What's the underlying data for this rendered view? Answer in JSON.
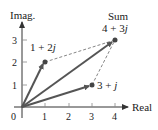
{
  "diagram": {
    "axes": {
      "x_label": "Real",
      "y_label": "Imag.",
      "origin_label": "0",
      "x_ticks": [
        "1",
        "2",
        "3",
        "4"
      ],
      "y_ticks": [
        "1",
        "2",
        "3"
      ]
    },
    "vectors": [
      {
        "name": "z1",
        "label": "1 + 2j",
        "re": 1,
        "im": 2
      },
      {
        "name": "z2",
        "label": "3 + j",
        "re": 3,
        "im": 1
      },
      {
        "name": "sum",
        "label": "4 + 3j",
        "caption": "Sum",
        "re": 4,
        "im": 3
      }
    ],
    "colors": {
      "vector": "#555555",
      "axis": "#333333",
      "dashed": "#666666",
      "point": "#444444"
    }
  },
  "labels": {
    "x_axis": "Real",
    "y_axis": "Imag.",
    "origin": "0",
    "xt1": "1",
    "xt2": "2",
    "xt3": "3",
    "xt4": "4",
    "yt1": "1",
    "yt2": "2",
    "yt3": "3",
    "z1": "1 + 2",
    "z2": "3 + ",
    "sum_caption": "Sum",
    "sum": "4 + 3",
    "j": "j"
  }
}
